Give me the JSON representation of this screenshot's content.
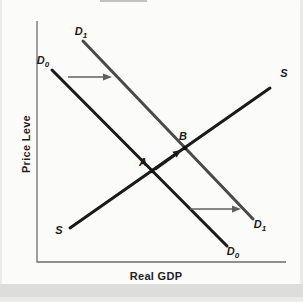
{
  "diagram": {
    "y_axis_label": "Price Leve",
    "x_axis_label": "Real GDP",
    "curves": {
      "demand_initial": {
        "label": "D",
        "sub": "0",
        "color": "#1a1a1a"
      },
      "demand_shifted": {
        "label": "D",
        "sub": "1",
        "color": "#4a4a4a"
      },
      "supply": {
        "label": "S",
        "color": "#1a1a1a"
      }
    },
    "points": {
      "initial_equilibrium": {
        "label": "A",
        "color": "#111111"
      },
      "new_equilibrium": {
        "label": "B",
        "color": "#111111"
      }
    },
    "colors": {
      "axis": "#6e6e6e",
      "shift_arrow": "#5f5f5f",
      "equilibrium_arrow": "#1a1a1a",
      "figure_background": "#fbfbf9",
      "bottom_band": "#dcdcda",
      "top_smudge": "#a3a3a3"
    }
  }
}
